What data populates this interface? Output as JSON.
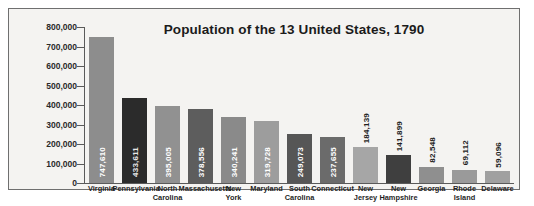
{
  "chart_data": {
    "type": "bar",
    "title": "Population of the 13 United States, 1790",
    "xlabel": "",
    "ylabel": "",
    "ylim": [
      0,
      800000
    ],
    "yticks": [
      "0",
      "100,000",
      "200,000",
      "300,000",
      "400,000",
      "500,000",
      "600,000",
      "700,000",
      "800,000"
    ],
    "ytick_values": [
      0,
      100000,
      200000,
      300000,
      400000,
      500000,
      600000,
      700000,
      800000
    ],
    "grid": false,
    "legend": "none",
    "categories": [
      "Virginia",
      "Pennsylvania",
      "North Carolina",
      "Massachusetts",
      "New York",
      "Maryland",
      "South Carolina",
      "Connecticut",
      "New Jersey",
      "New Hampshire",
      "Georgia",
      "Rhode Island",
      "Delaware"
    ],
    "values": [
      747610,
      433611,
      395005,
      378556,
      340241,
      319728,
      249073,
      237655,
      184139,
      141899,
      82548,
      69112,
      59096
    ],
    "value_labels": [
      "747,610",
      "433,611",
      "395,005",
      "378,556",
      "340,241",
      "319,728",
      "249,073",
      "237,655",
      "184,139",
      "141,899",
      "82,548",
      "69,112",
      "59,096"
    ],
    "bar_colors": [
      "#8d8d8d",
      "#2b2b2b",
      "#919191",
      "#5d5d5d",
      "#8a8a8a",
      "#9d9d9d",
      "#565656",
      "#6b6b6b",
      "#a6a6a6",
      "#3f3f3f",
      "#8f8f8f",
      "#9a9a9a",
      "#a0a0a0"
    ],
    "label_placement": [
      "inside",
      "inside",
      "inside",
      "inside",
      "inside",
      "inside",
      "inside",
      "inside",
      "outside",
      "outside",
      "outside",
      "outside",
      "outside"
    ],
    "category_lines": [
      [
        "Virginia"
      ],
      [
        "Pennsylvania"
      ],
      [
        "North",
        "Carolina"
      ],
      [
        "Massachusetts"
      ],
      [
        "New",
        "York"
      ],
      [
        "Maryland"
      ],
      [
        "South",
        "Carolina"
      ],
      [
        "Connecticut"
      ],
      [
        "New",
        "Jersey"
      ],
      [
        "New",
        "Hampshire"
      ],
      [
        "Georgia"
      ],
      [
        "Rhode",
        "Island"
      ],
      [
        "Delaware"
      ]
    ]
  }
}
